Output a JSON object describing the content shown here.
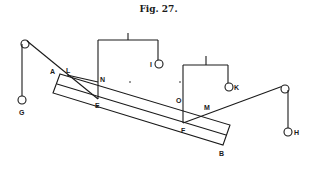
{
  "figure": {
    "title": "Fig. 27.",
    "labels": {
      "A": "A",
      "L": "L",
      "N": "N",
      "E": "E",
      "O": "O",
      "M": "M",
      "F": "F",
      "B": "B",
      "G": "G",
      "H": "H",
      "I": "I",
      "K": "K"
    },
    "components": [
      "inclined-bar-rectangle",
      "left-pulley",
      "right-pulley",
      "weight-G",
      "weight-H",
      "bracket-I",
      "bracket-K"
    ],
    "ink_color": "#1a1a1a",
    "background": "#ffffff"
  }
}
